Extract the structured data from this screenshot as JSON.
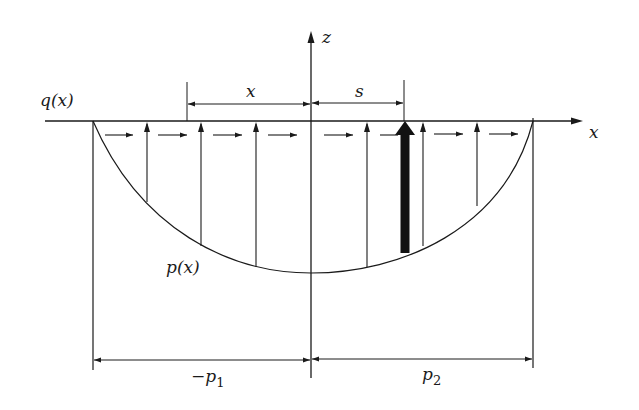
{
  "diagram": {
    "type": "contact pressure and traction distribution",
    "labels": {
      "z_axis": "z",
      "x_axis": "x",
      "traction": "q(x)",
      "pressure": "p(x)",
      "dim_x": "x",
      "dim_s": "s",
      "dim_left_main": "−p",
      "dim_left_sub": "1",
      "dim_right_main": "p",
      "dim_right_sub": "2"
    },
    "geometry": {
      "axis_y": 121,
      "origin_x": 311,
      "left_edge_x": 93,
      "right_edge_x": 533,
      "curve_bottom_y": 273,
      "x_dim_start": 187,
      "s_dim_end": 404,
      "bottom_dim_y": 360
    },
    "vertical_arrows_x": [
      147,
      201,
      256,
      367,
      423,
      477
    ],
    "thick_arrow_x": 405,
    "horizontal_arrows": [
      {
        "x1": 105,
        "x2": 133
      },
      {
        "x1": 158,
        "x2": 187
      },
      {
        "x1": 213,
        "x2": 242
      },
      {
        "x1": 268,
        "x2": 297
      },
      {
        "x1": 324,
        "x2": 353
      },
      {
        "x1": 380,
        "x2": 398
      },
      {
        "x1": 434,
        "x2": 463
      },
      {
        "x1": 489,
        "x2": 518
      }
    ],
    "colors": {
      "line": "#1a1a1a",
      "background": "#ffffff"
    }
  }
}
